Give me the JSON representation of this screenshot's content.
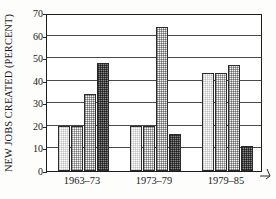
{
  "chart_data": {
    "type": "bar",
    "title": "",
    "subtitle": "",
    "xlabel": "",
    "ylabel": "NEW JOBS CREATED (PERCENT)",
    "categories": [
      "1963–73",
      "1973–79",
      "1979–85"
    ],
    "ylim": [
      0,
      70
    ],
    "ytick_values": [
      0,
      10,
      20,
      30,
      40,
      50,
      60,
      70
    ],
    "ytick_labels": [
      "0",
      "10",
      "20",
      "30",
      "40",
      "50",
      "60",
      "70"
    ],
    "grid": true,
    "grid_axis": "y",
    "legend": false,
    "legend_position": "none",
    "annotations": [],
    "series": [
      {
        "name": "series-1",
        "fill": "light-halftone",
        "color": "#f2f2f2",
        "values": [
          20.0,
          20.0,
          43.5
        ]
      },
      {
        "name": "series-2",
        "fill": "medium-light-halftone",
        "color": "#dcdcdc",
        "values": [
          20.0,
          20.0,
          43.5
        ]
      },
      {
        "name": "series-3",
        "fill": "medium-halftone",
        "color": "#d2d2d2",
        "values": [
          34.0,
          63.8,
          46.8
        ]
      },
      {
        "name": "series-4",
        "fill": "dark-halftone",
        "color": "#6e6e6e",
        "values": [
          48.0,
          16.4,
          11.0
        ]
      }
    ]
  },
  "axis": {
    "ylabel": "NEW JOBS CREATED (PERCENT)",
    "ytick_labels": [
      "70",
      "60",
      "50",
      "40",
      "30",
      "20",
      "10",
      "0"
    ],
    "xtick_labels": [
      "1963–73",
      "1973–79",
      "1979–85"
    ]
  },
  "colors": {
    "axis": "#1d1d1d",
    "gridline": "#4a4a4a",
    "text": "#17171a",
    "background": "#ffffff",
    "bar_outline": "#2b2b2b"
  }
}
